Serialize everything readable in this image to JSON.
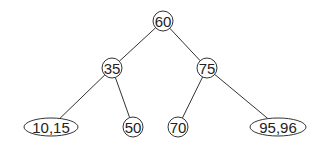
{
  "diagram": {
    "type": "b-tree",
    "nodes": [
      {
        "id": "n60",
        "label": "60",
        "shape": "circle",
        "cx": 163,
        "cy": 21,
        "rx": 10,
        "ry": 10
      },
      {
        "id": "n35",
        "label": "35",
        "shape": "circle",
        "cx": 112,
        "cy": 68,
        "rx": 10,
        "ry": 10
      },
      {
        "id": "n75",
        "label": "75",
        "shape": "circle",
        "cx": 207,
        "cy": 68,
        "rx": 10,
        "ry": 10
      },
      {
        "id": "n10_15",
        "label": "10,15",
        "shape": "ellipse",
        "cx": 51,
        "cy": 127,
        "rx": 27,
        "ry": 9
      },
      {
        "id": "n50",
        "label": "50",
        "shape": "circle",
        "cx": 133,
        "cy": 127,
        "rx": 10,
        "ry": 10
      },
      {
        "id": "n70",
        "label": "70",
        "shape": "circle",
        "cx": 178,
        "cy": 127,
        "rx": 10,
        "ry": 10
      },
      {
        "id": "n95_96",
        "label": "95,96",
        "shape": "ellipse",
        "cx": 278,
        "cy": 127,
        "rx": 28,
        "ry": 9
      }
    ],
    "edges": [
      {
        "from": "n60",
        "to": "n35"
      },
      {
        "from": "n60",
        "to": "n75"
      },
      {
        "from": "n35",
        "to": "n10_15"
      },
      {
        "from": "n35",
        "to": "n50"
      },
      {
        "from": "n75",
        "to": "n70"
      },
      {
        "from": "n75",
        "to": "n95_96"
      }
    ]
  }
}
